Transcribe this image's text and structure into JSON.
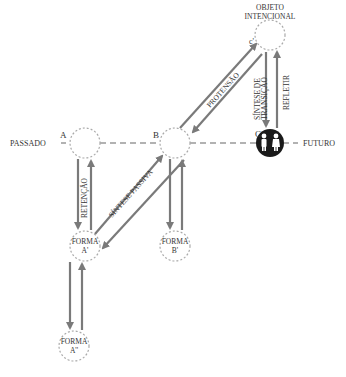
{
  "diagram": {
    "timeline": {
      "left_label": "PASSADO",
      "right_label": "FUTURO"
    },
    "nodes": {
      "a": {
        "label": "A"
      },
      "b": {
        "label": "B"
      },
      "c": {
        "label": "C",
        "icon": "people-icon"
      },
      "c_prime": {
        "label": "c'"
      },
      "objeto": {
        "line1": "OBJETO",
        "line2": "INTENCIONAL"
      },
      "forma_a1": {
        "line1": "FORMA",
        "line2": "A'"
      },
      "forma_b1": {
        "line1": "FORMA",
        "line2": "B'"
      },
      "forma_a2": {
        "line1": "FORMA",
        "line2": "A''"
      }
    },
    "arrows": {
      "retencao": "RETENÇÃO",
      "sintese_passiva": "SÍNTESE PASSIVA",
      "protensao": "PROTENSÃO",
      "sintese_transicao_1": "SÍNTESE DE",
      "sintese_transicao_2": "TRANSIÇÃO",
      "refletir": "REFLETIR"
    },
    "colors": {
      "arrow": "#7a7a7a",
      "dashed": "#999999",
      "circle_dotted": "#aaaaaa",
      "node_c_fill": "#1a1a1a",
      "text": "#333333"
    }
  }
}
